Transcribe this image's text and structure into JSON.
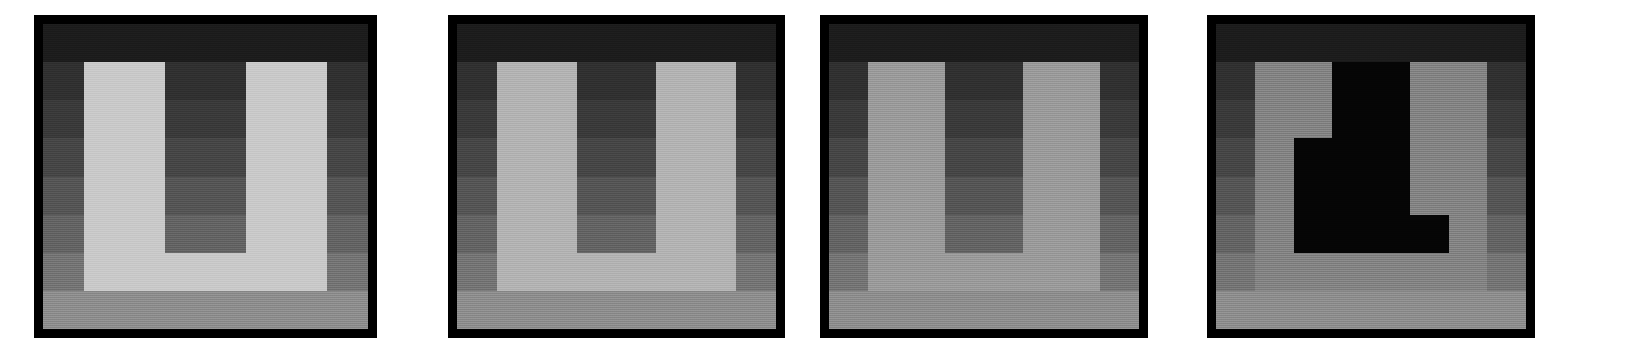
{
  "figure": {
    "type": "image-grid",
    "panel_count": 4,
    "grid_rows": 8,
    "grid_cols": 8,
    "background_color": "#ffffff",
    "border_color": "#000000",
    "border_width_px": 9
  },
  "background_gradient": {
    "description": "Background luminance ramp applied per row, dark at top to light at bottom",
    "row_colors": [
      "#1c1c1c",
      "#303030",
      "#3a3a3a",
      "#464646",
      "#555555",
      "#636363",
      "#747474",
      "#8d8d8d"
    ]
  },
  "panels": [
    {
      "id": "panel-1",
      "name": "high-contrast-light-u",
      "x": 34,
      "y": 15,
      "width": 343,
      "height": 323,
      "figure_color": "#c9c9c9",
      "figure_contrast_label": "highest",
      "mask": [
        [
          0,
          0,
          0,
          0,
          0,
          0,
          0,
          0
        ],
        [
          0,
          1,
          1,
          0,
          0,
          1,
          1,
          0
        ],
        [
          0,
          1,
          1,
          0,
          0,
          1,
          1,
          0
        ],
        [
          0,
          1,
          1,
          0,
          0,
          1,
          1,
          0
        ],
        [
          0,
          1,
          1,
          0,
          0,
          1,
          1,
          0
        ],
        [
          0,
          1,
          1,
          0,
          0,
          1,
          1,
          0
        ],
        [
          0,
          1,
          1,
          1,
          1,
          1,
          1,
          0
        ],
        [
          0,
          0,
          0,
          0,
          0,
          0,
          0,
          0
        ]
      ]
    },
    {
      "id": "panel-2",
      "name": "medium-high-contrast-u",
      "x": 448,
      "y": 15,
      "width": 337,
      "height": 323,
      "figure_color": "#b3b3b3",
      "figure_contrast_label": "high",
      "mask": [
        [
          0,
          0,
          0,
          0,
          0,
          0,
          0,
          0
        ],
        [
          0,
          1,
          1,
          0,
          0,
          1,
          1,
          0
        ],
        [
          0,
          1,
          1,
          0,
          0,
          1,
          1,
          0
        ],
        [
          0,
          1,
          1,
          0,
          0,
          1,
          1,
          0
        ],
        [
          0,
          1,
          1,
          0,
          0,
          1,
          1,
          0
        ],
        [
          0,
          1,
          1,
          0,
          0,
          1,
          1,
          0
        ],
        [
          0,
          1,
          1,
          1,
          1,
          1,
          1,
          0
        ],
        [
          0,
          0,
          0,
          0,
          0,
          0,
          0,
          0
        ]
      ]
    },
    {
      "id": "panel-3",
      "name": "medium-low-contrast-u",
      "x": 820,
      "y": 15,
      "width": 328,
      "height": 323,
      "figure_color": "#9a9a9a",
      "figure_contrast_label": "low",
      "mask": [
        [
          0,
          0,
          0,
          0,
          0,
          0,
          0,
          0
        ],
        [
          0,
          1,
          1,
          0,
          0,
          1,
          1,
          0
        ],
        [
          0,
          1,
          1,
          0,
          0,
          1,
          1,
          0
        ],
        [
          0,
          1,
          1,
          0,
          0,
          1,
          1,
          0
        ],
        [
          0,
          1,
          1,
          0,
          0,
          1,
          1,
          0
        ],
        [
          0,
          1,
          1,
          0,
          0,
          1,
          1,
          0
        ],
        [
          0,
          1,
          1,
          1,
          1,
          1,
          1,
          0
        ],
        [
          0,
          0,
          0,
          0,
          0,
          0,
          0,
          0
        ]
      ]
    },
    {
      "id": "panel-4",
      "name": "inverted-contrast-u",
      "x": 1207,
      "y": 15,
      "width": 328,
      "height": 323,
      "figure_color": "#838383",
      "figure_contrast_label": "inverted",
      "mask": [
        [
          0,
          0,
          0,
          0,
          0,
          0,
          0,
          0
        ],
        [
          0,
          1,
          1,
          0,
          0,
          1,
          1,
          0
        ],
        [
          0,
          1,
          1,
          0,
          0,
          1,
          1,
          0
        ],
        [
          0,
          1,
          1,
          0,
          0,
          1,
          1,
          0
        ],
        [
          0,
          1,
          1,
          0,
          0,
          1,
          1,
          0
        ],
        [
          0,
          1,
          1,
          0,
          0,
          1,
          1,
          0
        ],
        [
          0,
          1,
          1,
          1,
          1,
          1,
          1,
          0
        ],
        [
          0,
          0,
          0,
          0,
          0,
          0,
          0,
          0
        ]
      ],
      "interior_override_color": "#050505",
      "interior_mask": [
        [
          0,
          0,
          0,
          0,
          0,
          0,
          0,
          0
        ],
        [
          0,
          0,
          0,
          1,
          1,
          0,
          0,
          0
        ],
        [
          0,
          0,
          0,
          1,
          1,
          0,
          0,
          0
        ],
        [
          0,
          0,
          1,
          1,
          1,
          0,
          0,
          0
        ],
        [
          0,
          0,
          1,
          1,
          1,
          0,
          0,
          0
        ],
        [
          0,
          0,
          1,
          1,
          1,
          1,
          0,
          0
        ],
        [
          0,
          0,
          0,
          0,
          0,
          0,
          0,
          0
        ],
        [
          0,
          0,
          0,
          0,
          0,
          0,
          0,
          0
        ]
      ]
    }
  ]
}
